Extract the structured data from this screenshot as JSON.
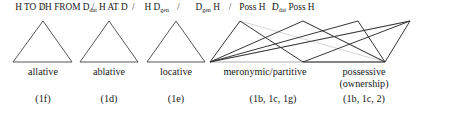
{
  "figure": {
    "type": "semantic-map-diagram",
    "width": 454,
    "height": 113,
    "background": "#ffffff",
    "line_color": "#2b2b2b",
    "faded_line_color": "#c9c9c9"
  },
  "header": {
    "separator": "/",
    "items": [
      {
        "id": "h-to-d",
        "text": "H TO D",
        "sub": "",
        "tail": "",
        "x": 91
      },
      {
        "id": "h-from-d-dat",
        "text": "H FROM D",
        "sub": "dat",
        "tail": "",
        "x": 213
      },
      {
        "id": "h-at-d",
        "text": "H AT D",
        "sub": "",
        "tail": "",
        "x": 340
      },
      {
        "id": "h-d-gen",
        "text": "H D",
        "sub": "gen",
        "tail": "",
        "x": 470
      },
      {
        "id": "d-gen-h",
        "text": "D",
        "sub": "gen",
        "tail": " H",
        "x": 623
      },
      {
        "id": "poss-h",
        "text": "Poss H",
        "sub": "",
        "tail": "",
        "x": 757
      },
      {
        "id": "d-dat-poss-h",
        "text": "D",
        "sub": "dat",
        "tail": " Poss H",
        "x": 880
      }
    ],
    "separators_x": [
      126,
      278,
      400,
      535,
      690,
      820
    ]
  },
  "categories": [
    {
      "id": "allative",
      "line1": "allative",
      "line2": "",
      "code": "(1f)",
      "x": 86
    },
    {
      "id": "ablative",
      "line1": "ablative",
      "line2": "",
      "code": "(1d)",
      "x": 207
    },
    {
      "id": "locative",
      "line1": "locative",
      "line2": "",
      "code": "(1e)",
      "x": 321
    },
    {
      "id": "meronymic",
      "line1": "meronymic/partitive",
      "line2": "",
      "code": "(1b, 1c, 1g)",
      "x": 438
    },
    {
      "id": "possessive",
      "line1": "possessive",
      "line2": "(ownership)",
      "code": "(1b, 1c, 2)",
      "x": 582
    }
  ],
  "shapes": {
    "triangles": [
      {
        "id": "triangle-allative",
        "left_x": 40,
        "apex_x": 86,
        "right_x": 132,
        "apex_y": 20,
        "base_y": 60
      },
      {
        "id": "triangle-ablative",
        "left_x": 161,
        "apex_x": 207,
        "right_x": 253,
        "apex_y": 20,
        "base_y": 60
      },
      {
        "id": "triangle-locative",
        "left_x": 275,
        "apex_x": 321,
        "right_x": 367,
        "apex_y": 20,
        "base_y": 60
      }
    ],
    "nodes": {
      "base_left_x": 210,
      "base_right_x": 385,
      "base_y": 60,
      "apex_y": 21,
      "apex_meronymic_x": 240,
      "apex_gen_h_x": 303,
      "apex_poss_h_x": 358,
      "apex_dat_poss_x": 410
    }
  }
}
